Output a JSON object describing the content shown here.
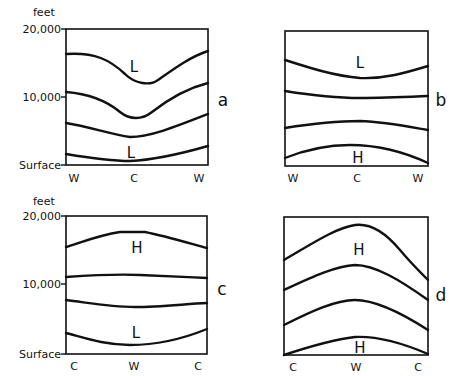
{
  "figure": {
    "y_axis": {
      "unit": "feet",
      "ticks": [
        "20,000",
        "10,000",
        "Surface"
      ]
    },
    "panels": [
      {
        "id": "a",
        "letter": "a",
        "x_labels": [
          "W",
          "C",
          "W"
        ],
        "pressure_labels": [
          "L",
          "L"
        ],
        "curves": [
          "M66,54 C95,52 110,60 125,74 C135,84 150,86 158,80 C175,68 190,57 208,51",
          "M66,92 C92,94 108,102 120,112 C130,120 142,120 152,112 C170,98 188,88 208,83",
          "M66,123 C90,127 110,134 130,137 C150,137 175,127 208,114",
          "M66,154 C90,158 110,161 130,161 C155,160 180,154 208,146"
        ]
      },
      {
        "id": "b",
        "letter": "b",
        "x_labels": [
          "W",
          "C",
          "W"
        ],
        "pressure_labels": [
          "L",
          "H"
        ],
        "curves": [
          "M285,60 C310,68 335,76 360,78 C385,79 405,73 428,66",
          "M285,91 C310,95 335,98 360,98 C385,98 405,97 428,96",
          "M285,128 C310,124 335,121 360,121 C385,122 405,126 428,130",
          "M285,158 C305,150 325,145 350,145 C375,145 400,150 428,163"
        ]
      },
      {
        "id": "c",
        "letter": "c",
        "x_labels": [
          "C",
          "W",
          "C"
        ],
        "pressure_labels": [
          "H",
          "L"
        ],
        "curves": [
          "M66,247 C85,241 100,235 120,232 L145,232 C165,236 185,242 207,248",
          "M66,277 C95,275 120,274 140,275 C165,276 185,277 207,278",
          "M66,300 C90,303 110,307 135,307 C160,307 185,304 207,303",
          "M66,333 C85,338 105,345 130,345 C155,345 180,340 207,329"
        ]
      },
      {
        "id": "d",
        "letter": "d",
        "x_labels": [
          "C",
          "W",
          "C"
        ],
        "pressure_labels": [
          "H",
          "H"
        ],
        "curves": [
          "M284,260 C310,245 335,228 355,225 C370,223 385,232 400,250 C410,262 420,272 428,280",
          "M284,290 C310,278 335,266 355,265 C375,265 400,280 428,300",
          "M284,325 C310,312 335,300 355,300 C375,300 400,312 428,330",
          "M284,355 C305,348 330,340 355,337 C375,336 400,342 428,354"
        ]
      }
    ]
  }
}
